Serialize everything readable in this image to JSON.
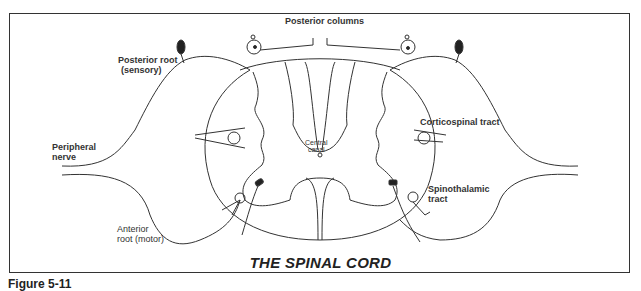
{
  "title": "THE SPINAL CORD",
  "figure_caption": "Figure 5-11",
  "labels": {
    "posterior_columns": "Posterior columns",
    "posterior_root_line1": "Posterior root",
    "posterior_root_line2": "(sensory)",
    "peripheral_nerve_line1": "Peripheral",
    "peripheral_nerve_line2": "nerve",
    "anterior_root_line1": "Anterior",
    "anterior_root_line2": "root (motor)",
    "central_canal_line1": "Central",
    "central_canal_line2": "canal",
    "corticospinal": "Corticospinal tract",
    "spinothalamic_line1": "Spinothalamic",
    "spinothalamic_line2": "tract"
  },
  "colors": {
    "line": "#333333",
    "background": "#ffffff"
  }
}
